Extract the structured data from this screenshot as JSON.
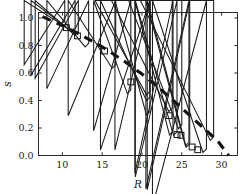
{
  "chart_data": {
    "type": "scatter",
    "title": "",
    "xlabel": "R",
    "ylabel": "s",
    "xlim": [
      7.0,
      32.0
    ],
    "ylim": [
      0.0,
      1.04
    ],
    "grid": false,
    "legend": "none",
    "xticks": [
      10,
      15,
      20,
      25,
      30
    ],
    "xtick_labels": [
      "10",
      "15",
      "20",
      "25",
      "30"
    ],
    "yticks": [
      0.0,
      0.2,
      0.4,
      0.6,
      0.8,
      1.0
    ],
    "ytick_labels": [
      "0.0",
      "0.2",
      "0.4",
      "0.6",
      "0.8",
      "1.0"
    ],
    "series": [
      {
        "name": "diamond-markers",
        "marker": "diamond",
        "color": "#1b1b1b",
        "points": [
          {
            "x": 10.3,
            "y": 0.955
          },
          {
            "x": 11.6,
            "y": 0.905
          },
          {
            "x": 12.0,
            "y": 0.875
          },
          {
            "x": 13.3,
            "y": 0.79
          },
          {
            "x": 16.7,
            "y": 0.635
          },
          {
            "x": 18.6,
            "y": 0.45
          },
          {
            "x": 21.0,
            "y": 0.4
          },
          {
            "x": 21.0,
            "y": 0.295
          },
          {
            "x": 23.9,
            "y": 0.15
          },
          {
            "x": 24.4,
            "y": 0.147
          },
          {
            "x": 25.9,
            "y": 0.07
          },
          {
            "x": 26.0,
            "y": 0.06
          },
          {
            "x": 28.1,
            "y": 0.022
          }
        ]
      },
      {
        "name": "square-markers",
        "marker": "square",
        "color": "#1b1b1b",
        "points": [
          {
            "x": 10.5,
            "y": 0.93
          },
          {
            "x": 11.9,
            "y": 0.87
          },
          {
            "x": 15.3,
            "y": 0.76
          },
          {
            "x": 18.6,
            "y": 0.535
          },
          {
            "x": 23.4,
            "y": 0.29
          },
          {
            "x": 24.4,
            "y": 0.152
          },
          {
            "x": 24.9,
            "y": 0.147
          },
          {
            "x": 26.3,
            "y": 0.062
          },
          {
            "x": 27.0,
            "y": 0.042
          }
        ]
      },
      {
        "name": "triangle-markers",
        "marker": "triangle",
        "color": "#1b1b1b",
        "points": [
          {
            "x": 21.0,
            "y": 0.44
          },
          {
            "x": 23.8,
            "y": 0.32
          },
          {
            "x": 25.0,
            "y": 0.195
          },
          {
            "x": 29.0,
            "y": 0.11
          }
        ]
      },
      {
        "name": "model-curve",
        "marker": "dashed-line",
        "color": "#111111",
        "points": [
          {
            "x": 7.5,
            "y": 1.01
          },
          {
            "x": 10.0,
            "y": 0.945
          },
          {
            "x": 12.5,
            "y": 0.872
          },
          {
            "x": 15.0,
            "y": 0.79
          },
          {
            "x": 17.5,
            "y": 0.697
          },
          {
            "x": 20.0,
            "y": 0.592
          },
          {
            "x": 22.5,
            "y": 0.474
          },
          {
            "x": 25.0,
            "y": 0.344
          },
          {
            "x": 27.5,
            "y": 0.212
          },
          {
            "x": 29.5,
            "y": 0.107
          },
          {
            "x": 30.9,
            "y": 0.0
          }
        ]
      }
    ]
  }
}
